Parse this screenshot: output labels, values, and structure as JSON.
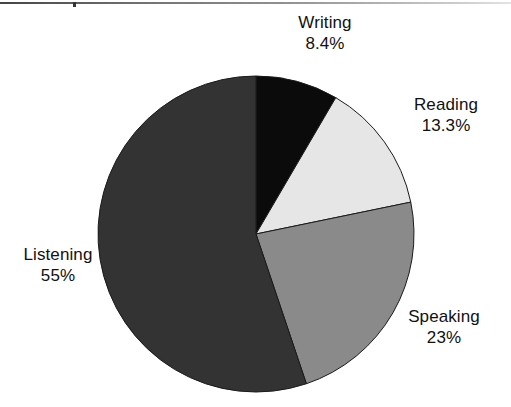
{
  "page": {
    "background_color": "#ffffff",
    "width": 511,
    "height": 407,
    "scan_artifact": "horizontal-rule-top"
  },
  "chart_data": {
    "type": "pie",
    "title": "",
    "subtitle": "",
    "xlabel": "",
    "ylabel": "",
    "legend_position": "none",
    "labels_position": "outside-callout",
    "grid": false,
    "start_angle_deg": 0,
    "direction": "clockwise",
    "categories": [
      "Writing",
      "Reading",
      "Speaking",
      "Listening"
    ],
    "values": [
      8.4,
      13.3,
      23,
      55
    ],
    "value_unit": "%",
    "value_labels": [
      "8.4%",
      "13.3%",
      "23%",
      "55%"
    ],
    "colors": [
      "#0b0b0b",
      "#e6e6e6",
      "#8a8a8a",
      "#333333"
    ],
    "slice_outline_color": "#1a1a1a",
    "slices": [
      {
        "name": "Writing",
        "value": 8.4,
        "value_label": "8.4%",
        "color": "#0b0b0b",
        "start_angle_deg": 0,
        "end_angle_deg": 30.24
      },
      {
        "name": "Reading",
        "value": 13.3,
        "value_label": "13.3%",
        "color": "#e6e6e6",
        "start_angle_deg": 30.24,
        "end_angle_deg": 78.12
      },
      {
        "name": "Speaking",
        "value": 23,
        "value_label": "23%",
        "color": "#8a8a8a",
        "start_angle_deg": 78.12,
        "end_angle_deg": 160.92
      },
      {
        "name": "Listening",
        "value": 55,
        "value_label": "55%",
        "color": "#333333",
        "start_angle_deg": 160.92,
        "end_angle_deg": 360
      }
    ],
    "geometry": {
      "center_x": 256,
      "center_y": 234,
      "radius": 158
    }
  }
}
